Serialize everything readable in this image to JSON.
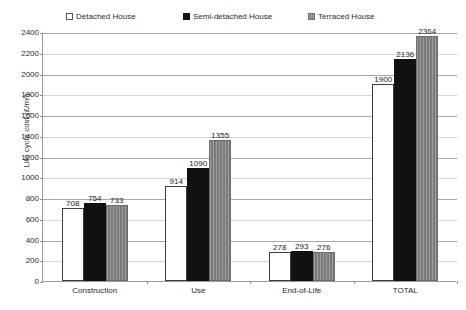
{
  "chart_data": {
    "type": "bar",
    "title": "",
    "xlabel": "",
    "ylabel": "Life cycle cost (£/m²)",
    "ylim": [
      0,
      2400
    ],
    "ytick_step": 200,
    "yticks": [
      0,
      200,
      400,
      600,
      800,
      1000,
      1200,
      1400,
      1600,
      1800,
      2000,
      2200,
      2400
    ],
    "grid": true,
    "legend_position": "top",
    "categories": [
      "Construction",
      "Use",
      "End-of-Life",
      "TOTAL"
    ],
    "series": [
      {
        "name": "Detached House",
        "color": "#ffffff",
        "edge_color": "#3d3d3d",
        "values": [
          708,
          914,
          278,
          1900
        ]
      },
      {
        "name": "Semi-detached House",
        "color": "#111111",
        "edge_color": "#111111",
        "values": [
          754,
          1090,
          293,
          2136
        ]
      },
      {
        "name": "Terraced House",
        "color": "#828282",
        "edge_color": "#6b6b6b",
        "values": [
          733,
          1355,
          276,
          2364
        ]
      }
    ]
  }
}
